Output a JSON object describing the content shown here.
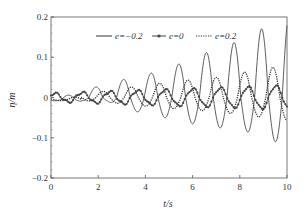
{
  "chart_data": {
    "type": "line",
    "title": "",
    "xlabel": "t/s",
    "ylabel": "η/m",
    "xlim": [
      0,
      10
    ],
    "ylim": [
      -0.2,
      0.2
    ],
    "xticks": [
      0,
      2,
      4,
      6,
      8,
      10
    ],
    "xtick_labels": [
      "0",
      "2",
      "4",
      "6",
      "8",
      "10"
    ],
    "yticks": [
      0.2,
      0.1,
      0,
      -0.1,
      -0.2
    ],
    "ytick_labels": [
      "0.2",
      "0.1",
      "0",
      "−0.1",
      "−0.2"
    ],
    "grid": false,
    "legend_position": "top-inside",
    "series": [
      {
        "name": "e=−0.2",
        "style": "solid",
        "color": "#333333",
        "period": 1.17,
        "phase_peak_t": 1.9,
        "peaks": [
          {
            "t": 1.9,
            "eta": 0.026
          },
          {
            "t": 3.0,
            "eta": 0.044
          },
          {
            "t": 4.2,
            "eta": 0.06
          },
          {
            "t": 5.4,
            "eta": 0.083
          },
          {
            "t": 6.5,
            "eta": 0.11
          },
          {
            "t": 7.7,
            "eta": 0.135
          },
          {
            "t": 8.9,
            "eta": 0.17
          }
        ],
        "troughs": [
          {
            "t": 2.4,
            "eta": -0.01
          },
          {
            "t": 3.6,
            "eta": -0.035
          },
          {
            "t": 4.8,
            "eta": -0.05
          },
          {
            "t": 5.95,
            "eta": -0.065
          },
          {
            "t": 7.1,
            "eta": -0.075
          },
          {
            "t": 8.3,
            "eta": -0.085
          },
          {
            "t": 9.5,
            "eta": -0.11
          }
        ],
        "end_value": 0.15
      },
      {
        "name": "e=0",
        "style": "solid-with-circle-markers",
        "color": "#444444",
        "period": 1.17,
        "phase_peak_t": 2.5,
        "amplitude_start": 0.01,
        "amplitude_end": 0.03,
        "end_value": 0.01
      },
      {
        "name": "e=0.2",
        "style": "dotted",
        "color": "#333333",
        "period": 1.2,
        "phase_peak_t": 3.4,
        "peaks": [
          {
            "t": 1.1,
            "eta": 0.01
          },
          {
            "t": 2.2,
            "eta": 0.015
          },
          {
            "t": 3.4,
            "eta": 0.026
          },
          {
            "t": 4.7,
            "eta": 0.036
          },
          {
            "t": 5.9,
            "eta": 0.044
          },
          {
            "t": 7.0,
            "eta": 0.05
          },
          {
            "t": 8.2,
            "eta": 0.063
          },
          {
            "t": 9.4,
            "eta": 0.075
          }
        ],
        "end_value": -0.06
      }
    ]
  },
  "legend": {
    "items": [
      {
        "label": "e=−0.2",
        "style": "solid"
      },
      {
        "label": "e=0",
        "style": "circle"
      },
      {
        "label": "e=0.2",
        "style": "dotted"
      }
    ]
  },
  "axes": {
    "xlabel": "t/s",
    "ylabel": "η/m"
  }
}
